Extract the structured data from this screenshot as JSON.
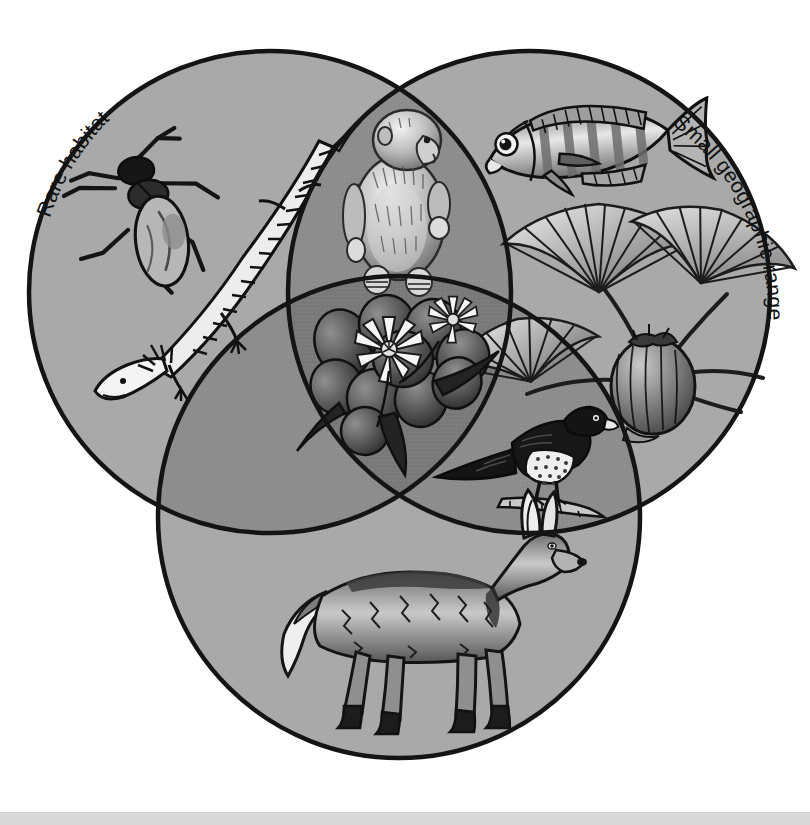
{
  "figure": {
    "type": "venn-diagram",
    "set_count": 3,
    "background_color": "#ffffff",
    "outline_color": "#111111",
    "region_fill_single": "#a9a9a9",
    "region_fill_pair": "#8d8d8d",
    "region_fill_triple": "#7a7a7a",
    "bottom_strip_color": "#d9d9d9"
  },
  "labels": {
    "rare_habitat": "Rare habitat",
    "small_geographic_range": "Small geographic range",
    "low_population_density": "Low population density"
  },
  "circles": [
    {
      "id": "rare-habitat",
      "label": "Rare habitat",
      "cx": 270,
      "cy": 292,
      "r": 241,
      "fill": "#a9a9a9"
    },
    {
      "id": "small-geographic-range",
      "label": "Small geographic range",
      "cx": 529,
      "cy": 292,
      "r": 241,
      "fill": "#a9a9a9"
    },
    {
      "id": "low-population-density",
      "label": "Low population density",
      "cx": 399,
      "cy": 517,
      "r": 241,
      "fill": "#a9a9a9"
    }
  ],
  "regions": [
    {
      "id": "rare-habitat-only",
      "sets": [
        "Rare habitat"
      ],
      "shade": "#a9a9a9",
      "organisms": [
        "cricket",
        "axolotl"
      ]
    },
    {
      "id": "small-geographic-range-only",
      "sets": [
        "Small geographic range"
      ],
      "shade": "#a9a9a9",
      "organisms": [
        "cichlid-fish",
        "palm-plant"
      ]
    },
    {
      "id": "low-population-density-only",
      "sets": [
        "Low population density"
      ],
      "shade": "#a9a9a9",
      "organisms": [
        "maned-wolf"
      ]
    },
    {
      "id": "rare-habitat-and-small-range",
      "sets": [
        "Rare habitat",
        "Small geographic range"
      ],
      "shade": "#8d8d8d",
      "organisms": [
        "primate"
      ]
    },
    {
      "id": "small-range-and-low-density",
      "sets": [
        "Small geographic range",
        "Low population density"
      ],
      "shade": "#8d8d8d",
      "organisms": [
        "raptor-bird"
      ]
    },
    {
      "id": "rare-habitat-and-low-density",
      "sets": [
        "Rare habitat",
        "Low population density"
      ],
      "shade": "#8d8d8d",
      "organisms": []
    },
    {
      "id": "all-three",
      "sets": [
        "Rare habitat",
        "Small geographic range",
        "Low population density"
      ],
      "shade": "#7a7a7a",
      "organisms": [
        "flowering-plant"
      ]
    }
  ],
  "organisms": [
    {
      "id": "cricket",
      "name": "cricket-illustration",
      "region": "rare-habitat-only",
      "x": 145,
      "y": 198
    },
    {
      "id": "axolotl",
      "name": "axolotl-illustration",
      "region": "rare-habitat-only",
      "x": 215,
      "y": 255
    },
    {
      "id": "primate",
      "name": "primate-illustration",
      "region": "rare-habitat-and-small-range",
      "x": 399,
      "y": 198
    },
    {
      "id": "cichlid-fish",
      "name": "cichlid-fish-illustration",
      "region": "small-geographic-range-only",
      "x": 585,
      "y": 145
    },
    {
      "id": "palm-plant",
      "name": "palm-plant-illustration",
      "region": "small-geographic-range-only",
      "x": 645,
      "y": 320
    },
    {
      "id": "flowering-plant",
      "name": "flowering-plant-illustration",
      "region": "all-three",
      "x": 399,
      "y": 365
    },
    {
      "id": "raptor-bird",
      "name": "raptor-bird-illustration",
      "region": "small-range-and-low-density",
      "x": 520,
      "y": 455
    },
    {
      "id": "maned-wolf",
      "name": "maned-wolf-illustration",
      "region": "low-population-density-only",
      "x": 400,
      "y": 630
    }
  ]
}
